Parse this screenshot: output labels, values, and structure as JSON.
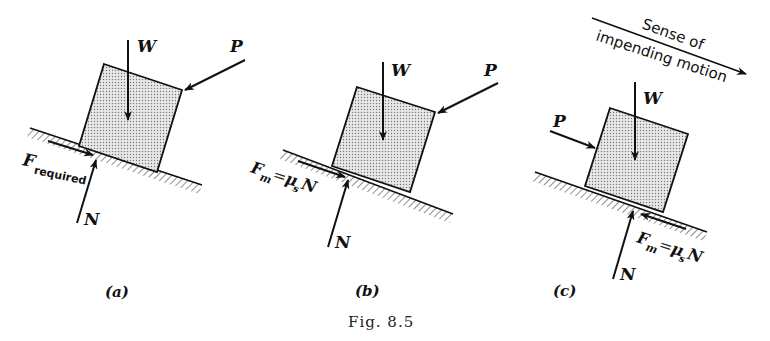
{
  "figure": {
    "caption": "Fig. 8.5",
    "colors": {
      "ink": "#111111",
      "block_fill": "#d9d9d9",
      "background": "#ffffff"
    }
  },
  "panels": [
    {
      "id": "a",
      "label": "(a)",
      "forces": {
        "weight": "W",
        "push": "P",
        "normal": "N",
        "friction_main": "F",
        "friction_sub": "required"
      }
    },
    {
      "id": "b",
      "label": "(b)",
      "forces": {
        "weight": "W",
        "push": "P",
        "normal": "N",
        "friction_main": "F",
        "friction_m": "m",
        "friction_eq": "=",
        "friction_mu": "μ",
        "friction_s": "s",
        "friction_N": "N"
      }
    },
    {
      "id": "c",
      "label": "(c)",
      "forces": {
        "weight": "W",
        "push": "P",
        "normal": "N",
        "friction_main": "F",
        "friction_m": "m",
        "friction_eq": "=",
        "friction_mu": "μ",
        "friction_s": "s",
        "friction_N": "N"
      },
      "motion_label_line1": "Sense of",
      "motion_label_line2": "impending motion"
    }
  ]
}
